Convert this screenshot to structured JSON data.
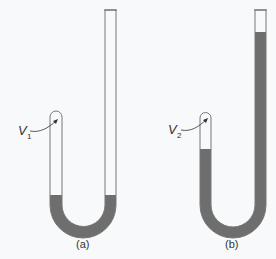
{
  "figure": {
    "panels": [
      {
        "id": "a",
        "caption": "(a)",
        "volume_label": "V",
        "volume_subscript": "1",
        "description": "J-tube with short closed left arm and tall open right arm; liquid only at the bottom bend, levels equal"
      },
      {
        "id": "b",
        "caption": "(b)",
        "volume_label": "V",
        "volume_subscript": "2",
        "description": "J-tube with liquid filling most of tube; right arm liquid column rises near the top, compressing trapped gas in left arm"
      }
    ],
    "colors": {
      "background": "#f7f9fa",
      "tube_outline": "#777777",
      "liquid": "#6e6e6e",
      "text": "#333333"
    }
  }
}
